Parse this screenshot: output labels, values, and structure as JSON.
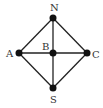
{
  "diagram": {
    "type": "graph",
    "nodes": [
      {
        "id": "N",
        "label": "N",
        "x": 53,
        "y": 18
      },
      {
        "id": "A",
        "label": "A",
        "x": 19,
        "y": 53
      },
      {
        "id": "B",
        "label": "B",
        "x": 53,
        "y": 53
      },
      {
        "id": "C",
        "label": "C",
        "x": 87,
        "y": 53
      },
      {
        "id": "S",
        "label": "S",
        "x": 53,
        "y": 88
      }
    ],
    "edges": [
      [
        "N",
        "A"
      ],
      [
        "N",
        "C"
      ],
      [
        "A",
        "S"
      ],
      [
        "C",
        "S"
      ],
      [
        "A",
        "B"
      ],
      [
        "B",
        "C"
      ],
      [
        "N",
        "B"
      ],
      [
        "B",
        "S"
      ]
    ],
    "colors": {
      "line": "#222222",
      "node": "#111111",
      "label": "#333333"
    }
  }
}
